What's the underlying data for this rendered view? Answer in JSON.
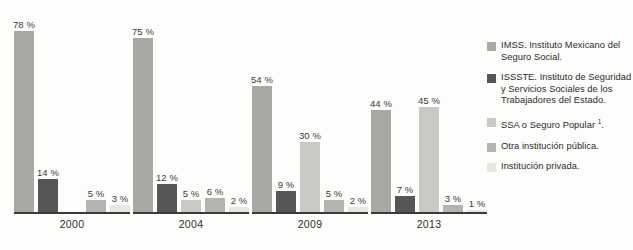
{
  "chart_data": {
    "type": "bar",
    "title": "",
    "subtitle": "",
    "xlabel": "",
    "ylabel": "",
    "ylim": [
      0,
      80
    ],
    "grid": false,
    "legend_position": "right",
    "value_suffix": "%",
    "categories": [
      "2000",
      "2004",
      "2009",
      "2013"
    ],
    "series": [
      {
        "name": "IMSS. Instituto Mexicano del Seguro Social.",
        "color": "#a8a8a4",
        "values": [
          78,
          75,
          54,
          44
        ],
        "labels": [
          "78 %",
          "75 %",
          "54 %",
          "44 %"
        ]
      },
      {
        "name": "ISSSTE. Instituto de Seguridad y Servicios Sociales de los Trabajadores del Estado.",
        "color": "#565656",
        "values": [
          14,
          12,
          9,
          7
        ],
        "labels": [
          "14 %",
          "12 %",
          "9 %",
          "7 %"
        ]
      },
      {
        "name": "SSA o Seguro Popular 1.",
        "color": "#c9c9c5",
        "values": [
          null,
          5,
          30,
          45
        ],
        "labels": [
          "",
          "5 %",
          "30 %",
          "45 %"
        ]
      },
      {
        "name": "Otra institución pública.",
        "color": "#b3b3af",
        "values": [
          5,
          6,
          5,
          3
        ],
        "labels": [
          "5 %",
          "6 %",
          "5 %",
          "3 %"
        ]
      },
      {
        "name": "Institución privada.",
        "color": "#e6e6e2",
        "values": [
          3,
          2,
          2,
          1
        ],
        "labels": [
          "3 %",
          "2 %",
          "2 %",
          "1 %"
        ]
      }
    ]
  },
  "groups": [
    {
      "year": "2000",
      "bars": [
        {
          "label": "78 %",
          "value": 78,
          "color": "#a8a8a4",
          "series": "IMSS"
        },
        {
          "label": "14 %",
          "value": 14,
          "color": "#565656",
          "series": "ISSSTE"
        },
        {
          "label": "",
          "value": 0,
          "color": "transparent",
          "series": "SSA"
        },
        {
          "label": "5 %",
          "value": 5,
          "color": "#b3b3af",
          "series": "Otra"
        },
        {
          "label": "3 %",
          "value": 3,
          "color": "#e6e6e2",
          "series": "Privada"
        }
      ]
    },
    {
      "year": "2004",
      "bars": [
        {
          "label": "75 %",
          "value": 75,
          "color": "#a8a8a4",
          "series": "IMSS"
        },
        {
          "label": "12 %",
          "value": 12,
          "color": "#565656",
          "series": "ISSSTE"
        },
        {
          "label": "5 %",
          "value": 5,
          "color": "#c9c9c5",
          "series": "SSA"
        },
        {
          "label": "6 %",
          "value": 6,
          "color": "#b3b3af",
          "series": "Otra"
        },
        {
          "label": "2 %",
          "value": 2,
          "color": "#e6e6e2",
          "series": "Privada"
        }
      ]
    },
    {
      "year": "2009",
      "bars": [
        {
          "label": "54 %",
          "value": 54,
          "color": "#a8a8a4",
          "series": "IMSS"
        },
        {
          "label": "9 %",
          "value": 9,
          "color": "#565656",
          "series": "ISSSTE"
        },
        {
          "label": "30 %",
          "value": 30,
          "color": "#c9c9c5",
          "series": "SSA"
        },
        {
          "label": "5 %",
          "value": 5,
          "color": "#b3b3af",
          "series": "Otra"
        },
        {
          "label": "2 %",
          "value": 2,
          "color": "#e6e6e2",
          "series": "Privada"
        }
      ]
    },
    {
      "year": "2013",
      "bars": [
        {
          "label": "44 %",
          "value": 44,
          "color": "#a8a8a4",
          "series": "IMSS"
        },
        {
          "label": "7 %",
          "value": 7,
          "color": "#565656",
          "series": "ISSSTE"
        },
        {
          "label": "45 %",
          "value": 45,
          "color": "#c9c9c5",
          "series": "SSA"
        },
        {
          "label": "3 %",
          "value": 3,
          "color": "#b3b3af",
          "series": "Otra"
        },
        {
          "label": "1 %",
          "value": 1,
          "color": "#e6e6e2",
          "series": "Privada"
        }
      ]
    }
  ],
  "legend": {
    "items": [
      {
        "color": "#a8a8a4",
        "text": "IMSS. Instituto Mexicano del Seguro Social."
      },
      {
        "color": "#565656",
        "text": "ISSSTE. Instituto de Seguridad y Servicios Sociales de los Trabajadores del Estado."
      },
      {
        "color": "#c9c9c5",
        "text": "SSA o Seguro Popular ",
        "sup": "1",
        "text_after": "."
      },
      {
        "color": "#b3b3af",
        "text": "Otra institución pública."
      },
      {
        "color": "#e6e6e2",
        "text": "Institución privada."
      }
    ]
  }
}
